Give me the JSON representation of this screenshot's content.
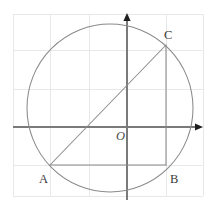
{
  "figure": {
    "width": 212,
    "height": 209,
    "background_color": "#ffffff"
  },
  "colors": {
    "grid": "#e8e8e8",
    "axis": "#7a7a7a",
    "circle": "#8a8a8a",
    "triangle": "#8a8a8a",
    "label": "#3a3a3a",
    "origin_label": "#4a4a4a"
  },
  "grid": {
    "visible": true,
    "vertical_x": [
      13,
      50,
      89,
      127,
      166,
      203
    ],
    "horizontal_y": [
      14,
      50,
      89,
      127,
      165,
      196
    ]
  },
  "axes": {
    "origin": {
      "x": 127,
      "y": 127
    },
    "x_axis": {
      "x1": 13,
      "y1": 127,
      "x2": 203,
      "y2": 127,
      "arrow": "right"
    },
    "y_axis": {
      "x1": 127,
      "y1": 200,
      "x2": 127,
      "y2": 13,
      "arrow": "up"
    }
  },
  "circle": {
    "center_x": 110,
    "center_y": 108,
    "radius_x": 83,
    "radius_y": 84
  },
  "triangle": {
    "vertices": [
      {
        "name": "A",
        "x": 50,
        "y": 165
      },
      {
        "name": "B",
        "x": 166,
        "y": 165
      },
      {
        "name": "C",
        "x": 166,
        "y": 45
      }
    ],
    "edges": [
      {
        "from": "A",
        "to": "B"
      },
      {
        "from": "B",
        "to": "C"
      },
      {
        "from": "C",
        "to": "A"
      }
    ]
  },
  "labels": {
    "origin": {
      "text": "O",
      "x": 116,
      "y": 140
    },
    "a": {
      "text": "A",
      "x": 39,
      "y": 183
    },
    "b": {
      "text": "B",
      "x": 170,
      "y": 183
    },
    "c": {
      "text": "C",
      "x": 164,
      "y": 39
    }
  }
}
